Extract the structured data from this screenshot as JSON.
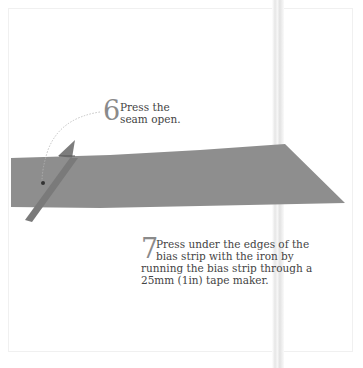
{
  "steps": [
    {
      "number": "6",
      "lines": [
        "Press the",
        "seam open."
      ]
    },
    {
      "number": "7",
      "lines": [
        "Press under the edges of the",
        "bias strip with the iron by",
        "running the bias strip through a",
        "25mm (1in) tape maker."
      ]
    }
  ],
  "colors": {
    "fabric": "#8f8f8f",
    "fabric_dark": "#7a7a7a",
    "number": "#8a8a8a",
    "text": "#444444"
  }
}
